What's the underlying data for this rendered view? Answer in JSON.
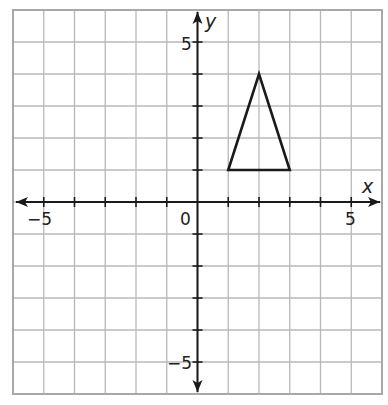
{
  "chart_data": {
    "type": "scatter",
    "title": "",
    "xlabel": "x",
    "ylabel": "y",
    "xlim": [
      -6,
      6
    ],
    "ylim": [
      -6,
      6
    ],
    "grid": true,
    "grid_step": 1,
    "x_tick_labels": [
      {
        "value": -5,
        "label": "−5"
      },
      {
        "value": 0,
        "label": "0"
      },
      {
        "value": 5,
        "label": "5"
      }
    ],
    "y_tick_labels": [
      {
        "value": 5,
        "label": "5"
      },
      {
        "value": -5,
        "label": "−5"
      }
    ],
    "shapes": [
      {
        "name": "triangle",
        "type": "polygon",
        "vertices": [
          [
            1,
            1
          ],
          [
            2,
            4
          ],
          [
            3,
            1
          ]
        ]
      }
    ],
    "colors": {
      "grid": "#b8b8b8",
      "axis": "#1a1a1a",
      "shape": "#1a1a1a"
    }
  },
  "labels": {
    "x_axis": "x",
    "y_axis": "y",
    "x_neg5": "−5",
    "x_0": "0",
    "x_5": "5",
    "y_5": "5",
    "y_neg5": "−5"
  }
}
